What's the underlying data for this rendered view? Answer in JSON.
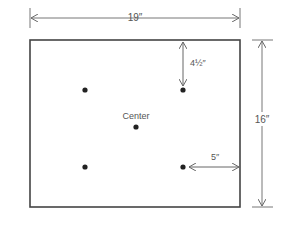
{
  "diagram": {
    "type": "dimensioned-layout",
    "colors": {
      "line": "#444444",
      "dim_line": "#777777",
      "dot": "#222222",
      "text": "#555555"
    },
    "width_label": "19″",
    "height_label": "16″",
    "top_offset_label": "4½″",
    "side_offset_label": "5″",
    "center_label": "Center",
    "points": [
      {
        "name": "top-left",
        "x": 85,
        "y": 90
      },
      {
        "name": "top-right",
        "x": 183,
        "y": 90
      },
      {
        "name": "center",
        "x": 136,
        "y": 127
      },
      {
        "name": "bottom-left",
        "x": 85,
        "y": 167
      },
      {
        "name": "bottom-right",
        "x": 183,
        "y": 167
      }
    ]
  }
}
